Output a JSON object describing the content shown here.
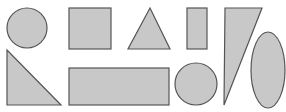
{
  "canvas": {
    "width": 286,
    "height": 112,
    "background": "#ffffff"
  },
  "style": {
    "fill": "#c8c8c8",
    "stroke": "#555555"
  },
  "shapes": [
    {
      "id": "circle-1",
      "type": "circle",
      "cx": 27,
      "cy": 28,
      "r": 20
    },
    {
      "id": "square",
      "type": "rect",
      "x": 69,
      "y": 8,
      "width": 42,
      "height": 41
    },
    {
      "id": "triangle",
      "type": "polygon",
      "points": "150,8 128,49 170,49"
    },
    {
      "id": "tall-rectangle",
      "type": "rect",
      "x": 187,
      "y": 8,
      "width": 20,
      "height": 41
    },
    {
      "id": "right-triangle-top",
      "type": "polygon",
      "points": "225,8 262,8 224,105"
    },
    {
      "id": "ellipse",
      "type": "ellipse",
      "cx": 268,
      "cy": 70,
      "rx": 17,
      "ry": 38
    },
    {
      "id": "right-triangle-bottom",
      "type": "polygon",
      "points": "7,50 7,105 61,105"
    },
    {
      "id": "wide-rectangle",
      "type": "rect",
      "x": 69,
      "y": 68,
      "width": 100,
      "height": 37
    },
    {
      "id": "circle-2",
      "type": "circle",
      "cx": 196,
      "cy": 84,
      "r": 21
    }
  ]
}
